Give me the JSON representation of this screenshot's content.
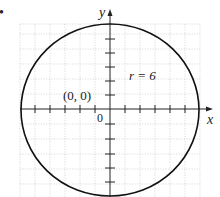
{
  "figure": {
    "bullet": "•",
    "axes": {
      "x_label": "x",
      "y_label": "y",
      "origin_label": "0"
    },
    "annotations": {
      "center_label": "(0, 0)",
      "radius_label": "r = 6"
    },
    "circle": {
      "center": [
        0,
        0
      ],
      "radius": 6
    },
    "grid": {
      "xmin": -6,
      "xmax": 6,
      "ymin": -6,
      "ymax": 6,
      "step": 1
    },
    "colors": {
      "curve": "#111111",
      "axis": "#222222",
      "grid": "#bbbbbb"
    }
  }
}
